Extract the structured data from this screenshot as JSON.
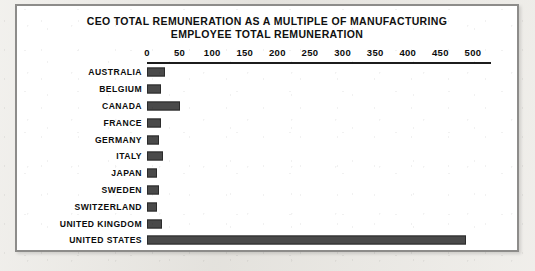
{
  "chart_data": {
    "type": "bar",
    "orientation": "horizontal",
    "title": "CEO TOTAL REMUNERATION AS A MULTIPLE OF MANUFACTURING EMPLOYEE TOTAL REMUNERATION",
    "title_lines": [
      "CEO TOTAL REMUNERATION AS A MULTIPLE OF MANUFACTURING",
      "EMPLOYEE TOTAL REMUNERATION"
    ],
    "subtitle": "",
    "xlabel": "",
    "ylabel": "",
    "xlim": [
      0,
      500
    ],
    "grid": false,
    "legend": false,
    "axis_position": "top",
    "tick_labels": [
      "0",
      "50",
      "100",
      "150",
      "200",
      "250",
      "300",
      "350",
      "400",
      "450",
      "500"
    ],
    "ticks": [
      0,
      50,
      100,
      150,
      200,
      250,
      300,
      350,
      400,
      450,
      500
    ],
    "categories": [
      "AUSTRALIA",
      "BELGIUM",
      "CANADA",
      "FRANCE",
      "GERMANY",
      "ITALY",
      "JAPAN",
      "SWEDEN",
      "SWITZERLAND",
      "UNITED KINGDOM",
      "UNITED STATES"
    ],
    "values": [
      27,
      22,
      50,
      21,
      18,
      25,
      16,
      18,
      16,
      23,
      490
    ],
    "bar_color": "#4a4a4a",
    "bar_border_color": "#2b2b2b",
    "axis_color": "#1c1c1c",
    "text_color": "#0c0c0c",
    "background_color": "#ffffff",
    "frame_color": "#8d8c8a"
  }
}
